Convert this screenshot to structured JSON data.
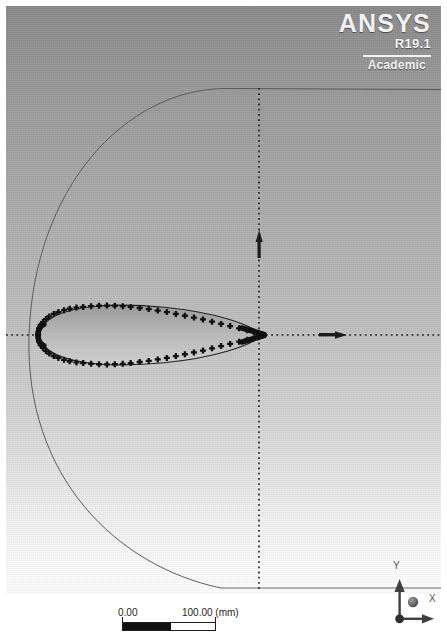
{
  "window": {
    "title": "ANSYS DesignModeler Graphics Viewport",
    "width": 447,
    "height": 639
  },
  "logo": {
    "brand": "ANSYS",
    "release": "R19.1",
    "license": "Academic",
    "color": "#f2f2f2"
  },
  "viewport": {
    "background_top_color": "#8b8b8b",
    "background_bottom_color": "#ffffff",
    "border_color": "#ffffff"
  },
  "scale_bar": {
    "min_label": "0.00",
    "max_label": "100.00 (mm)",
    "unit": "mm",
    "min_value": 0.0,
    "max_value": 100.0,
    "fill_color": "#111111"
  },
  "triad": {
    "x_label": "X",
    "y_label": "Y",
    "z_label": "Z",
    "color": "#4a4a4a"
  },
  "geometry": {
    "name": "airfoil-c-mesh-domain",
    "entities": [
      {
        "name": "airfoil-profile",
        "type": "spline-with-vertices",
        "color": "#1a1a1a"
      },
      {
        "name": "farfield-arc",
        "type": "arc",
        "color": "#4f4f4f"
      },
      {
        "name": "domain-top-edge",
        "type": "line",
        "color": "#4f4f4f"
      },
      {
        "name": "domain-bottom-edge",
        "type": "line",
        "color": "#4f4f4f"
      },
      {
        "name": "domain-right-edge",
        "type": "line",
        "color": "#4f4f4f"
      },
      {
        "name": "horizontal-axis",
        "type": "dotted-axis",
        "color": "#2a2a2a"
      },
      {
        "name": "vertical-axis",
        "type": "dotted-axis",
        "color": "#2a2a2a"
      }
    ]
  },
  "chart_data": {
    "type": "scatter",
    "title": "",
    "xlabel": "X",
    "ylabel": "Y",
    "note": "Airfoil section outline constructed from coordinate points; surrounding C-type far-field boundary.",
    "series": [
      {
        "name": "airfoil-upper-surface",
        "x": [
          0.0,
          0.005,
          0.012,
          0.022,
          0.035,
          0.05,
          0.07,
          0.09,
          0.115,
          0.14,
          0.17,
          0.2,
          0.235,
          0.27,
          0.305,
          0.34,
          0.375,
          0.41,
          0.45,
          0.49,
          0.53,
          0.57,
          0.61,
          0.65,
          0.69,
          0.73,
          0.77,
          0.81,
          0.85,
          0.89,
          0.925,
          0.955,
          0.975,
          0.99,
          1.0
        ],
        "y": [
          0.0,
          0.018,
          0.027,
          0.035,
          0.043,
          0.05,
          0.057,
          0.062,
          0.067,
          0.071,
          0.074,
          0.076,
          0.078,
          0.079,
          0.0795,
          0.079,
          0.078,
          0.076,
          0.073,
          0.07,
          0.066,
          0.062,
          0.057,
          0.052,
          0.047,
          0.042,
          0.036,
          0.03,
          0.024,
          0.018,
          0.013,
          0.009,
          0.006,
          0.003,
          0.0
        ]
      },
      {
        "name": "airfoil-lower-surface",
        "x": [
          0.0,
          0.005,
          0.012,
          0.022,
          0.035,
          0.05,
          0.07,
          0.09,
          0.115,
          0.14,
          0.17,
          0.2,
          0.235,
          0.27,
          0.305,
          0.34,
          0.375,
          0.41,
          0.45,
          0.49,
          0.53,
          0.57,
          0.61,
          0.65,
          0.69,
          0.73,
          0.77,
          0.81,
          0.85,
          0.89,
          0.925,
          0.955,
          0.975,
          0.99,
          1.0
        ],
        "y": [
          0.0,
          -0.018,
          -0.027,
          -0.035,
          -0.043,
          -0.05,
          -0.057,
          -0.062,
          -0.067,
          -0.071,
          -0.074,
          -0.076,
          -0.078,
          -0.079,
          -0.0795,
          -0.079,
          -0.078,
          -0.076,
          -0.073,
          -0.07,
          -0.066,
          -0.062,
          -0.057,
          -0.052,
          -0.047,
          -0.042,
          -0.036,
          -0.03,
          -0.024,
          -0.018,
          -0.013,
          -0.009,
          -0.006,
          -0.003,
          0.0
        ]
      }
    ],
    "xlim": [
      -6,
      4
    ],
    "ylim": [
      -5,
      5
    ],
    "grid": false,
    "legend": "none"
  }
}
